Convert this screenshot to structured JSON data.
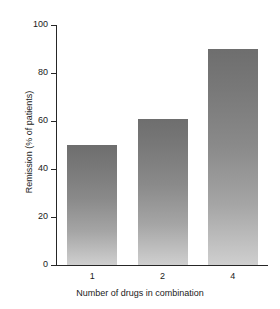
{
  "chart_data": {
    "type": "bar",
    "title": "",
    "subtitle": "",
    "categories": [
      "1",
      "2",
      "4"
    ],
    "values": [
      50,
      61,
      90
    ],
    "series": [
      {
        "name": "Remission",
        "values": [
          50,
          61,
          90
        ]
      }
    ],
    "xlabel": "Number of drugs in combination",
    "ylabel": "Remission (% of patients)",
    "ylim": [
      0,
      100
    ],
    "yticks": [
      0,
      20,
      40,
      60,
      80,
      100
    ],
    "ytick_labels": [
      "0",
      "20",
      "40",
      "60",
      "80",
      "100"
    ],
    "xtick_labels": [
      "1",
      "2",
      "4"
    ],
    "grid": false,
    "legend": false,
    "legend_position": "none",
    "annotations": [],
    "colors": {
      "bar_top": "#6e6e6e",
      "bar_bottom": "#cfcfcf",
      "axis": "#262626",
      "text": "#1a1a1a",
      "background": "#ffffff"
    }
  }
}
